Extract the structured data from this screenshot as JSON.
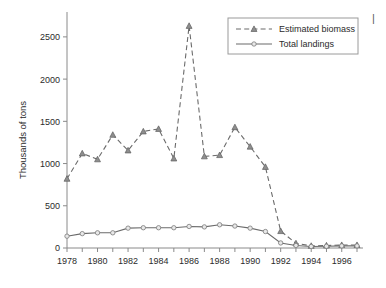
{
  "chart_data": {
    "type": "line",
    "title": "",
    "xlabel": "",
    "ylabel": "Thousands of tons",
    "x": [
      1978,
      1979,
      1980,
      1981,
      1982,
      1983,
      1984,
      1985,
      1986,
      1987,
      1988,
      1989,
      1990,
      1991,
      1992,
      1993,
      1994,
      1995,
      1996,
      1997
    ],
    "xlim": [
      1978,
      1997
    ],
    "ylim": [
      0,
      2700
    ],
    "yticks": [
      0,
      500,
      1000,
      1500,
      2000,
      2500
    ],
    "xticks_labeled": [
      1978,
      1980,
      1982,
      1984,
      1986,
      1988,
      1990,
      1992,
      1994,
      1996
    ],
    "xticks_all": [
      1978,
      1979,
      1980,
      1981,
      1982,
      1983,
      1984,
      1985,
      1986,
      1987,
      1988,
      1989,
      1990,
      1991,
      1992,
      1993,
      1994,
      1995,
      1996,
      1997
    ],
    "grid": false,
    "legend_position": "top-right",
    "series": [
      {
        "name": "Estimated biomass",
        "style": "dashed",
        "marker": "triangle",
        "color": "#6b6b6b",
        "values": [
          820,
          1120,
          1050,
          1340,
          1155,
          1380,
          1410,
          1060,
          2630,
          1085,
          1100,
          1430,
          1200,
          960,
          200,
          55,
          25,
          30,
          35,
          35
        ]
      },
      {
        "name": "Total landings",
        "style": "solid",
        "marker": "circle",
        "color": "#6b6b6b",
        "values": [
          140,
          170,
          180,
          180,
          235,
          240,
          240,
          240,
          255,
          250,
          275,
          260,
          235,
          195,
          60,
          30,
          18,
          20,
          25,
          25
        ]
      }
    ]
  },
  "axis": {
    "ylabel_text": "Thousands of tons",
    "ytick_labels": [
      "0",
      "500",
      "1000",
      "1500",
      "2000",
      "2500"
    ],
    "xtick_labels": [
      "1978",
      "1980",
      "1982",
      "1984",
      "1986",
      "1988",
      "1990",
      "1992",
      "1994",
      "1996"
    ]
  },
  "legend": {
    "entries": [
      {
        "label": "Estimated biomass"
      },
      {
        "label": "Total landings"
      }
    ]
  },
  "artifact": {
    "corner_mark": "|"
  },
  "colors": {
    "line": "#6b6b6b",
    "axis": "#8a8a8a",
    "text": "#2b2b2b",
    "background": "#ffffff"
  }
}
